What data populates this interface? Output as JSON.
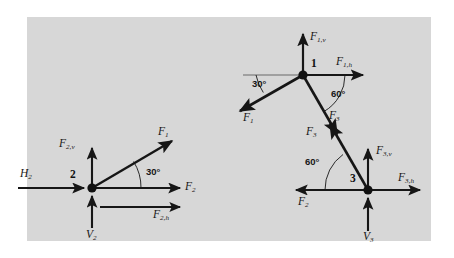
{
  "figure": {
    "background_color": "#ffffff",
    "panel_color": "#d7d7d7",
    "ink_color": "#161616"
  },
  "joints": [
    {
      "id": "joint-2",
      "number": "2",
      "x": 92,
      "y": 188,
      "labels": {
        "vertical_component": {
          "base": "F",
          "sub": "2,v"
        },
        "horizontal_component": {
          "base": "F",
          "sub": "2,h"
        },
        "member_force": {
          "base": "F",
          "sub": "1"
        },
        "reaction_h": {
          "base": "H",
          "sub": "2"
        },
        "reaction_v": {
          "base": "V",
          "sub": "2"
        },
        "axis_force": {
          "base": "F",
          "sub": "2"
        }
      },
      "angle": {
        "value": "30",
        "unit": "°",
        "text": "30°"
      }
    },
    {
      "id": "joint-1",
      "number": "1",
      "x": 303,
      "y": 75,
      "labels": {
        "vertical_component": {
          "base": "F",
          "sub": "1,v"
        },
        "horizontal_component": {
          "base": "F",
          "sub": "1,h"
        },
        "member_force_left": {
          "base": "F",
          "sub": "1"
        },
        "member_force_right": {
          "base": "F",
          "sub": "3"
        }
      },
      "angle_left": {
        "value": "30",
        "unit": "°",
        "text": "30°"
      },
      "angle_right": {
        "value": "60",
        "unit": "°",
        "text": "60°"
      }
    },
    {
      "id": "joint-3",
      "number": "3",
      "x": 368,
      "y": 190,
      "labels": {
        "vertical_component": {
          "base": "F",
          "sub": "3,v"
        },
        "horizontal_component": {
          "base": "F",
          "sub": "3,h"
        },
        "member_force": {
          "base": "F",
          "sub": "3"
        },
        "axis_force": {
          "base": "F",
          "sub": "2"
        },
        "reaction_v": {
          "base": "V",
          "sub": "3"
        }
      },
      "angle": {
        "value": "60",
        "unit": "°",
        "text": "60°"
      }
    }
  ]
}
